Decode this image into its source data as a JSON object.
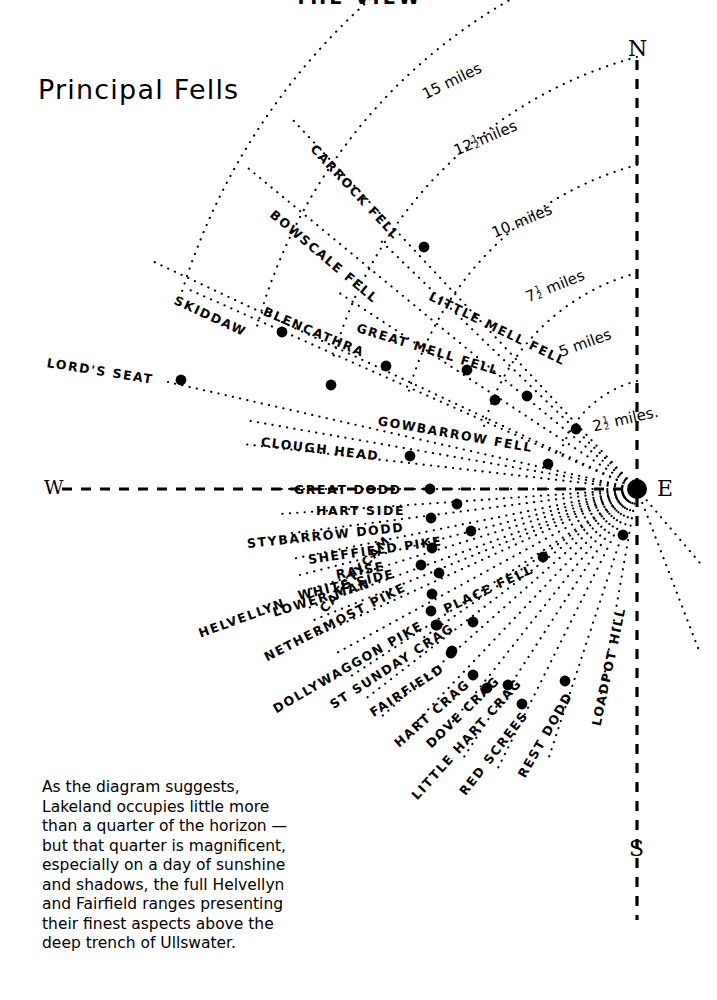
{
  "page": {
    "clipped_title": "THE VIEW",
    "heading": "Principal Fells"
  },
  "compass": {
    "north": "N",
    "east": "E",
    "south": "S",
    "west": "W"
  },
  "distance_rings": [
    {
      "label": "2½ miles",
      "num": "2",
      "frac_n": "1",
      "frac_d": "2",
      "unit": "miles.",
      "radius": 108
    },
    {
      "label": "5 miles",
      "num": "5",
      "frac_n": "",
      "frac_d": "",
      "unit": "miles",
      "radius": 216
    },
    {
      "label": "7½ miles",
      "num": "7",
      "frac_n": "1",
      "frac_d": "2",
      "unit": "miles",
      "radius": 324
    },
    {
      "label": "10 miles",
      "num": "10",
      "frac_n": "",
      "frac_d": "",
      "unit": "miles",
      "radius": 432
    },
    {
      "label": "12½ miles",
      "num": "12",
      "frac_n": "1",
      "frac_d": "2",
      "unit": "miles",
      "radius": 540
    },
    {
      "label": "15 miles",
      "num": "15",
      "frac_n": "",
      "frac_d": "",
      "unit": "miles",
      "radius": 648
    }
  ],
  "fells": [
    {
      "name": "CARROCK FELL",
      "angle": -47,
      "dot_r": 0
    },
    {
      "name": "BOWSCALE FELL",
      "angle": -40,
      "dot_r": 0
    },
    {
      "name": "SKIDDAW",
      "angle": -26,
      "dot_r": 0
    },
    {
      "name": "BLENCATHRA",
      "angle": -23,
      "dot_r": 0
    },
    {
      "name": "GREAT MELL FELL",
      "angle": -17,
      "dot_r": 0
    },
    {
      "name": "LITTLE MELL FELL",
      "angle": -22,
      "dot_r": 0
    },
    {
      "name": "LORD'S SEAT",
      "angle": -13,
      "dot_r": 0
    },
    {
      "name": "GOWBARROW FELL",
      "angle": -10,
      "dot_r": 0
    },
    {
      "name": "CLOUGH HEAD",
      "angle": -7,
      "dot_r": 0
    },
    {
      "name": "GREAT DODD",
      "angle": 0,
      "dot_r": 0
    },
    {
      "name": "HART SIDE",
      "angle": 4,
      "dot_r": 0
    },
    {
      "name": "STYBARROW DODD",
      "angle": 7,
      "dot_r": 0
    },
    {
      "name": "SHEFFIELD PIKE",
      "angle": 11,
      "dot_r": 0
    },
    {
      "name": "RAISE",
      "angle": 14,
      "dot_r": 0
    },
    {
      "name": "WHITE SIDE",
      "angle": 17,
      "dot_r": 0
    },
    {
      "name": "LOWER MAN",
      "angle": 20,
      "dot_r": 0
    },
    {
      "name": "HELVELLYN",
      "angle": 23,
      "dot_r": 0
    },
    {
      "name": "CATSTYCAM",
      "angle": 21,
      "dot_r": 0
    },
    {
      "name": "NETHERMOST PIKE",
      "angle": 27,
      "dot_r": 0
    },
    {
      "name": "DOLLYWAGGON PIKE",
      "angle": 31,
      "dot_r": 0
    },
    {
      "name": "ST SUNDAY CRAG",
      "angle": 34,
      "dot_r": 0
    },
    {
      "name": "FAIRFIELD",
      "angle": 37,
      "dot_r": 0
    },
    {
      "name": "PLACE FELL",
      "angle": 25,
      "dot_r": 0
    },
    {
      "name": "HART CRAG",
      "angle": 40,
      "dot_r": 0
    },
    {
      "name": "DOVE CRAG",
      "angle": 44,
      "dot_r": 0
    },
    {
      "name": "LITTLE HART CRAG",
      "angle": 48,
      "dot_r": 0
    },
    {
      "name": "RED SCREES",
      "angle": 52,
      "dot_r": 0
    },
    {
      "name": "REST DODD",
      "angle": 57,
      "dot_r": 0
    },
    {
      "name": "LOADPOT HILL",
      "angle": 72,
      "dot_r": 0
    }
  ],
  "note_lines": [
    "As the diagram suggests,",
    "Lakeland occupies little more",
    "than a quarter of the horizon —",
    "but that quarter is magnificent,",
    "especially on a day of sunshine",
    "and shadows, the full Helvellyn",
    "and Fairfield ranges presenting",
    "their finest aspects above the",
    "deep trench of Ullswater."
  ],
  "colors": {
    "ink": "#000000",
    "paper": "#ffffff"
  }
}
